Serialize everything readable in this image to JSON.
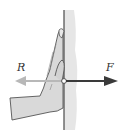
{
  "diagram": {
    "forces": [
      {
        "label": "R",
        "direction": "left",
        "color": "#b8b8b8"
      },
      {
        "label": "F",
        "direction": "right",
        "color": "#3a3a3a"
      }
    ],
    "colors": {
      "wall_fill": "#e6e6e6",
      "wall_line": "#4a4a4a",
      "hand_fill": "#d9d9d9",
      "hand_outline": "#555555"
    }
  }
}
